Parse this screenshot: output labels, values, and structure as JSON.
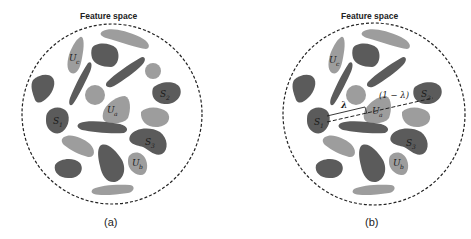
{
  "panels": [
    {
      "id": "a",
      "title": "Feature space",
      "caption": "(a)",
      "labels": {
        "uc": {
          "main": "U",
          "sub": "c"
        },
        "ua": {
          "main": "U",
          "sub": "a"
        },
        "ub": {
          "main": "U",
          "sub": "b"
        },
        "s1": {
          "main": "S",
          "sub": "1"
        },
        "s2": {
          "main": "S",
          "sub": "2"
        },
        "s3": {
          "main": "S",
          "sub": "3"
        }
      }
    },
    {
      "id": "b",
      "title": "Feature space",
      "caption": "(b)",
      "labels": {
        "uc": {
          "main": "U",
          "sub": "c"
        },
        "ua": {
          "main": "U",
          "sub": "a"
        },
        "ub": {
          "main": "U",
          "sub": "b"
        },
        "s1": {
          "main": "S",
          "sub": "1"
        },
        "s2": {
          "main": "S",
          "sub": "2"
        },
        "s3": {
          "main": "S",
          "sub": "3"
        }
      },
      "lambda": "λ",
      "one_minus_lambda": "(1 − λ)"
    }
  ],
  "colors": {
    "dark_cluster": "#5b5b5b",
    "light_cluster": "#9d9d9d",
    "boundary": "#222222"
  }
}
